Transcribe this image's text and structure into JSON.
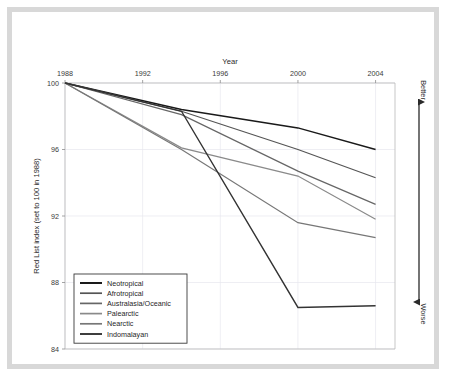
{
  "figure": {
    "frame_color": "#d8d8d8",
    "background": "#ffffff"
  },
  "annotations": {
    "better_label": "Better",
    "worse_label": "Worse"
  },
  "chart_data": {
    "type": "line",
    "title": "",
    "xlabel": "Year",
    "ylabel": "Red List index (set to 100 in 1988)",
    "xlim": [
      1988,
      2005
    ],
    "ylim": [
      84,
      100
    ],
    "xticks": [
      1988,
      1992,
      1996,
      2000,
      2004
    ],
    "xtick_labels": [
      "1988",
      "1992",
      "1996",
      "2000",
      "2004"
    ],
    "yticks": [
      84,
      88,
      92,
      96,
      100
    ],
    "ytick_labels": [
      "84",
      "88",
      "92",
      "96",
      "100"
    ],
    "xaxis_position": "top",
    "grid": true,
    "legend_position": "lower left",
    "series": [
      {
        "name": "Neotropical",
        "color": "#1a1a1a",
        "width": 1.5,
        "x": [
          1988,
          1994,
          2000,
          2004
        ],
        "y": [
          100.0,
          98.4,
          97.3,
          96.0
        ]
      },
      {
        "name": "Afrotropical",
        "color": "#555555",
        "width": 1.2,
        "x": [
          1988,
          1994,
          2000,
          2004
        ],
        "y": [
          100.0,
          98.3,
          96.0,
          94.3
        ]
      },
      {
        "name": "Australasia/Oceanic",
        "color": "#666666",
        "width": 1.2,
        "x": [
          1988,
          1994,
          2000,
          2004
        ],
        "y": [
          100.0,
          98.1,
          94.7,
          92.7
        ]
      },
      {
        "name": "Palearctic",
        "color": "#8a8a8a",
        "width": 1.2,
        "x": [
          1988,
          1994,
          2000,
          2004
        ],
        "y": [
          100.0,
          96.1,
          94.4,
          91.8
        ]
      },
      {
        "name": "Nearctic",
        "color": "#777777",
        "width": 1.2,
        "x": [
          1988,
          1994,
          2000,
          2004
        ],
        "y": [
          100.0,
          96.0,
          91.6,
          90.7
        ]
      },
      {
        "name": "Indomalayan",
        "color": "#333333",
        "width": 1.4,
        "x": [
          1988,
          1994,
          2000,
          2004
        ],
        "y": [
          100.0,
          98.3,
          86.5,
          86.6
        ]
      }
    ]
  }
}
